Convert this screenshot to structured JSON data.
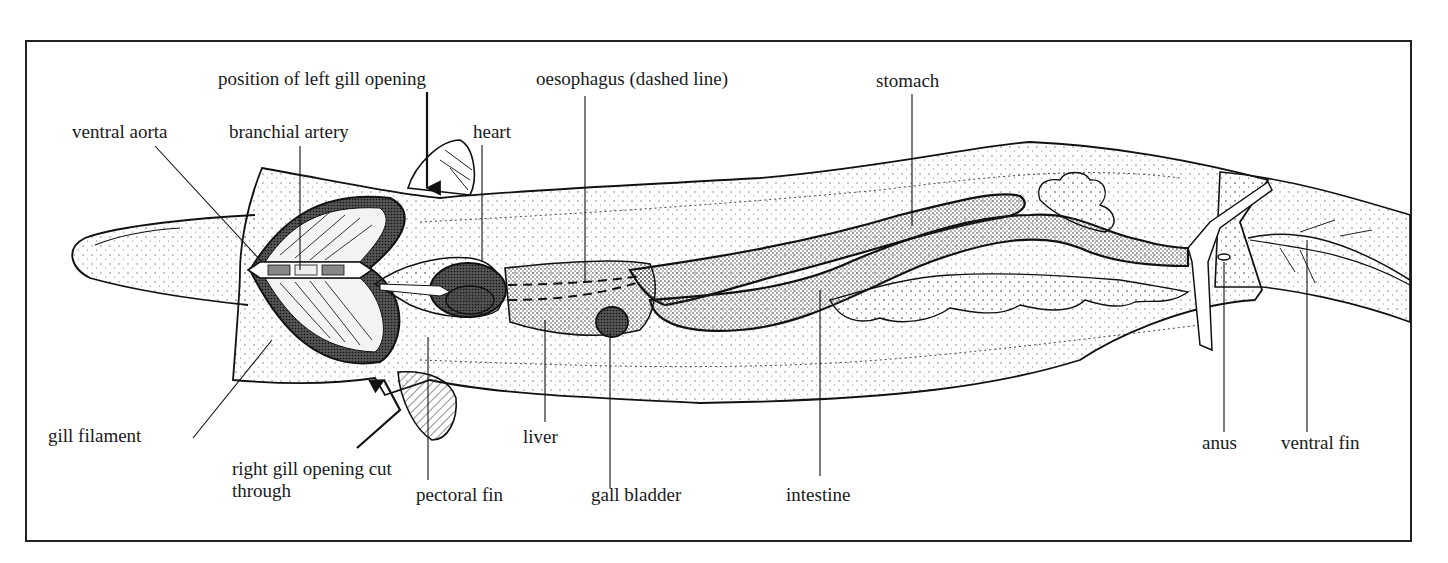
{
  "figure": {
    "labels": {
      "position_left_gill_opening": "position of left gill opening",
      "oesophagus": "oesophagus (dashed line)",
      "stomach": "stomach",
      "ventral_aorta": "ventral aorta",
      "branchial_artery": "branchial artery",
      "heart": "heart",
      "gill_filament": "gill filament",
      "right_gill_opening": "right gill opening cut through",
      "pectoral_fin": "pectoral fin",
      "liver": "liver",
      "gall_bladder": "gall bladder",
      "intestine": "intestine",
      "anus": "anus",
      "ventral_fin": "ventral fin"
    },
    "colors": {
      "ink": "#111111",
      "background": "#ffffff",
      "stipple": "#555555"
    }
  }
}
